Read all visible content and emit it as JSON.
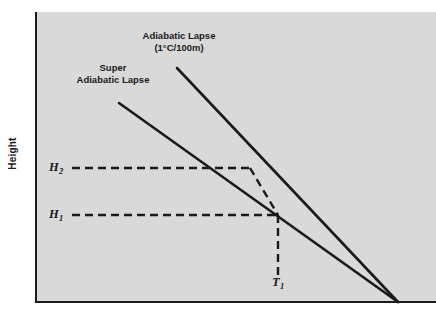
{
  "figure": {
    "background_color": "#ffffff",
    "panel_color": "#d9d9d9",
    "axis_color": "#1a1a1a",
    "line_color": "#1a1a1a"
  },
  "axes": {
    "y_title": "Height",
    "x_title": "",
    "y_ticks": [
      {
        "id": "H2",
        "label": "H",
        "subscript": "2",
        "pixel_y": 168
      },
      {
        "id": "H1",
        "label": "H",
        "subscript": "1",
        "pixel_y": 215
      }
    ],
    "x_ticks": [
      {
        "id": "T1",
        "label": "T",
        "subscript": "1",
        "pixel_x": 278
      }
    ]
  },
  "annotations": {
    "adiabatic": {
      "line1": "Adiabatic Lapse",
      "line2": "(1°C/100m)"
    },
    "super_adiabatic": {
      "line1": "Super",
      "line2": "Adiabatic Lapse"
    }
  },
  "chart_data": {
    "type": "line",
    "title": "",
    "subtitle": "",
    "xlabel": "",
    "ylabel": "Height",
    "grid": false,
    "legend_position": "inline-annotations",
    "axis_note": "Temperature increases to the right on the x-axis; Height increases upward on the y-axis. Both lapse-rate lines slope down to the right and converge at the x-axis.",
    "series": [
      {
        "name": "Adiabatic Lapse (1°C/100m)",
        "style": "solid",
        "width": 2.6,
        "color": "#1a1a1a",
        "points": [
          {
            "x": 177,
            "y": 68
          },
          {
            "x": 398,
            "y": 302
          }
        ]
      },
      {
        "name": "Super Adiabatic Lapse",
        "style": "solid",
        "width": 2.6,
        "color": "#1a1a1a",
        "points": [
          {
            "x": 119,
            "y": 103
          },
          {
            "x": 398,
            "y": 302
          }
        ]
      },
      {
        "name": "H2 construction line",
        "style": "dashed",
        "width": 2.4,
        "color": "#1a1a1a",
        "points": [
          {
            "x": 72,
            "y": 168
          },
          {
            "x": 250,
            "y": 168
          }
        ]
      },
      {
        "name": "H2 to H1 projection",
        "style": "dashed",
        "width": 2.4,
        "color": "#1a1a1a",
        "points": [
          {
            "x": 250,
            "y": 168
          },
          {
            "x": 278,
            "y": 215
          }
        ]
      },
      {
        "name": "H1 construction line",
        "style": "dashed",
        "width": 2.4,
        "color": "#1a1a1a",
        "points": [
          {
            "x": 72,
            "y": 215
          },
          {
            "x": 278,
            "y": 215
          }
        ]
      },
      {
        "name": "T1 construction line",
        "style": "dashed",
        "width": 2.4,
        "color": "#1a1a1a",
        "points": [
          {
            "x": 278,
            "y": 215
          },
          {
            "x": 278,
            "y": 275
          }
        ]
      }
    ],
    "intersections": [
      {
        "name": "H2 on super-adiabatic",
        "x": 250,
        "y": 168
      },
      {
        "name": "H1 at T1 on adiabatic",
        "x": 278,
        "y": 215
      },
      {
        "name": "convergence at x-axis",
        "x": 398,
        "y": 302
      }
    ]
  }
}
